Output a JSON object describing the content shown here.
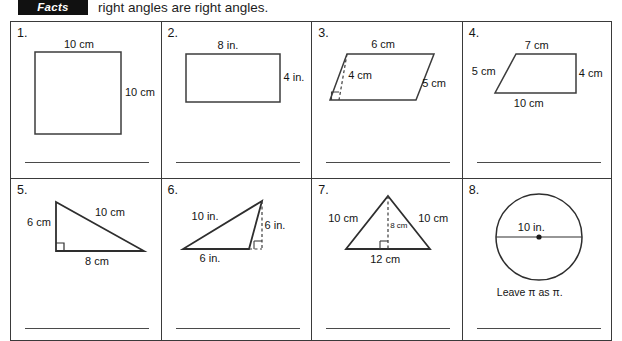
{
  "header": {
    "badge": "Facts",
    "text": "right angles are right angles."
  },
  "worksheet": {
    "problems": [
      {
        "number": "1.",
        "shape": "square",
        "labels": {
          "top": "10 cm",
          "right": "10 cm"
        }
      },
      {
        "number": "2.",
        "shape": "rectangle",
        "labels": {
          "top": "8 in.",
          "right": "4 in."
        }
      },
      {
        "number": "3.",
        "shape": "parallelogram",
        "labels": {
          "top": "6 cm",
          "height": "4 cm",
          "side": "5 cm"
        }
      },
      {
        "number": "4.",
        "shape": "trapezoid",
        "labels": {
          "top": "7 cm",
          "left": "5 cm",
          "right": "4 cm",
          "bottom": "10 cm"
        }
      },
      {
        "number": "5.",
        "shape": "right-triangle",
        "labels": {
          "left": "6 cm",
          "hypotenuse": "10 cm",
          "bottom": "8 cm"
        }
      },
      {
        "number": "6.",
        "shape": "obtuse-triangle",
        "labels": {
          "side": "10 in.",
          "height": "6 in.",
          "base": "6 in."
        }
      },
      {
        "number": "7.",
        "shape": "isosceles-triangle",
        "labels": {
          "left": "10 cm",
          "right": "10 cm",
          "height": "8 cm",
          "base": "12 cm"
        }
      },
      {
        "number": "8.",
        "shape": "circle",
        "labels": {
          "diameter": "10 in."
        },
        "note": "Leave π as π."
      }
    ]
  },
  "colors": {
    "ink": "#1a1a1a",
    "rule": "#3a3a3a",
    "badge_bg": "#111111",
    "badge_fg": "#ffffff"
  }
}
